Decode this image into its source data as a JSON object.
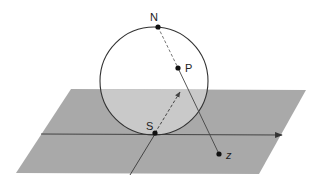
{
  "diagram": {
    "colors": {
      "background": "#ffffff",
      "plane": "#a9a9a9",
      "plane_inside_sphere": "#c9c9c9",
      "line": "#333333",
      "dashed": "#555555",
      "point": "#111111"
    },
    "plane": {
      "corners": [
        [
          71,
          89
        ],
        [
          306,
          90
        ],
        [
          259,
          174
        ],
        [
          16,
          173
        ]
      ]
    },
    "sphere": {
      "cx": 154,
      "cy": 81,
      "r": 54
    },
    "axes": {
      "horizontal": {
        "from": [
          41,
          134
        ],
        "to": [
          282,
          135
        ]
      },
      "oblique": {
        "from": [
          155,
          134
        ],
        "to": [
          130,
          175
        ]
      }
    },
    "points": [
      {
        "id": "N",
        "label": "N",
        "x": 158,
        "y": 27,
        "label_x": 150,
        "label_y": 21
      },
      {
        "id": "P",
        "label": "P",
        "x": 178,
        "y": 68,
        "label_x": 185,
        "label_y": 72
      },
      {
        "id": "S",
        "label": "S",
        "x": 155,
        "y": 133,
        "label_x": 147,
        "label_y": 130
      },
      {
        "id": "z",
        "label": "z",
        "x": 219,
        "y": 154,
        "label_x": 226,
        "label_y": 159
      }
    ],
    "lines": {
      "N_to_P_dashed": {
        "from": [
          158,
          27
        ],
        "to": [
          178,
          68
        ]
      },
      "P_to_z_solid": {
        "from": [
          178,
          68
        ],
        "to": [
          219,
          154
        ]
      },
      "S_arrow_dashed": {
        "from": [
          155,
          133
        ],
        "to": [
          180,
          92
        ]
      }
    }
  }
}
